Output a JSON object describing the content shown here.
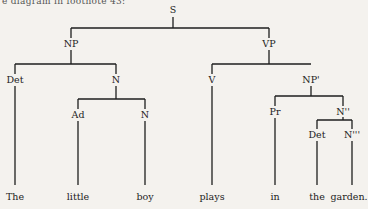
{
  "caption": "e diagram in footnote 43:",
  "tree": {
    "nodes": {
      "S": "S",
      "NP": "NP",
      "VP": "VP",
      "Det1": "Det",
      "N1": "N",
      "Ad": "Ad",
      "N2": "N",
      "V": "V",
      "NPp": "NP'",
      "Pr": "Pr",
      "Npp": "N''",
      "Det2": "Det",
      "Nppp": "N'''"
    },
    "leaves": [
      "The",
      "little",
      "boy",
      "plays",
      "in",
      "the",
      "garden."
    ],
    "leaf_group_last": "the garden."
  }
}
